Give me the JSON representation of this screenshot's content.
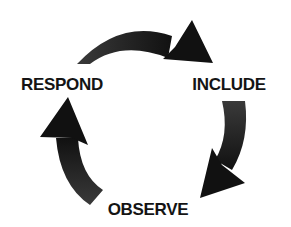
{
  "diagram": {
    "type": "cycle",
    "nodes": [
      {
        "id": "respond",
        "label": "RESPOND",
        "x": 62,
        "y": 84
      },
      {
        "id": "include",
        "label": "INCLUDE",
        "x": 229,
        "y": 84
      },
      {
        "id": "observe",
        "label": "OBSERVE",
        "x": 148,
        "y": 209
      }
    ],
    "edges": [
      {
        "from": "respond",
        "to": "include",
        "direction": "clockwise"
      },
      {
        "from": "include",
        "to": "observe",
        "direction": "clockwise"
      },
      {
        "from": "observe",
        "to": "respond",
        "direction": "clockwise"
      }
    ],
    "colors": {
      "arrow_fill": "#2e2e2e",
      "text": "#141414",
      "background": "#ffffff"
    }
  }
}
